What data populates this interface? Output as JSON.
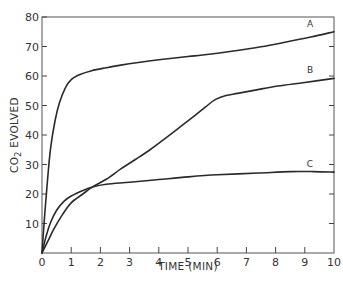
{
  "chart_data": {
    "type": "line",
    "title": "",
    "xlabel": "TIME (MIN)",
    "ylabel": "CO2 EVOLVED",
    "ylabel_main": "CO",
    "ylabel_sub": "2",
    "ylabel_rest": " EVOLVED",
    "xlim": [
      0,
      10
    ],
    "ylim": [
      0,
      80
    ],
    "x_ticks": [
      0,
      1,
      2,
      3,
      4,
      5,
      6,
      7,
      8,
      9,
      10
    ],
    "y_ticks": [
      10,
      20,
      30,
      40,
      50,
      60,
      70,
      80
    ],
    "y_tick_labels": [
      "10",
      "20",
      "30",
      "40",
      "50",
      "60",
      "70",
      "80"
    ],
    "x_tick_labels": [
      "0",
      "1",
      "2",
      "3",
      "4",
      "5",
      "6",
      "7",
      "8",
      "9",
      "10"
    ],
    "origin_label": "0",
    "grid": false,
    "legend": "inline labels at right end of curves",
    "series": [
      {
        "name": "A",
        "x": [
          0,
          0.1,
          0.2,
          0.3,
          0.45,
          0.6,
          0.8,
          1.0,
          1.3,
          1.7,
          2.2,
          2.7,
          3.3,
          4.0,
          5.0,
          5.5,
          6.5,
          7.5,
          8.4,
          9.2,
          10.0
        ],
        "y": [
          0,
          14,
          26,
          36,
          45,
          51,
          56,
          58.8,
          60.5,
          61.8,
          62.8,
          63.7,
          64.6,
          65.5,
          66.6,
          67.1,
          68.4,
          69.9,
          71.6,
          73.2,
          75.0
        ]
      },
      {
        "name": "B",
        "x": [
          0,
          0.2,
          0.4,
          0.7,
          1.0,
          1.4,
          1.73,
          2.2,
          2.7,
          3.2,
          3.7,
          4.2,
          4.7,
          5.2,
          5.6,
          5.93,
          6.3,
          6.7,
          7.3,
          8.07,
          9.0,
          10.0
        ],
        "y": [
          0,
          4,
          8,
          13,
          17,
          20,
          22.4,
          25,
          28.5,
          31.7,
          35,
          38.7,
          42.5,
          46.3,
          49.5,
          52,
          53.4,
          54.1,
          55.2,
          56.6,
          57.8,
          59.2
        ]
      },
      {
        "name": "C",
        "x": [
          0,
          0.15,
          0.3,
          0.5,
          0.75,
          1.0,
          1.4,
          1.73,
          2.2,
          3.0,
          4.0,
          5.0,
          6.0,
          7.4,
          8.5,
          9.3,
          10.0
        ],
        "y": [
          0,
          6,
          10.5,
          14.5,
          17.5,
          19.3,
          21.2,
          22.4,
          23.3,
          24.0,
          24.9,
          25.8,
          26.5,
          27.1,
          27.6,
          27.6,
          27.4
        ]
      }
    ]
  }
}
